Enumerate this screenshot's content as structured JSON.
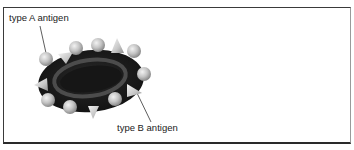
{
  "figure": {
    "labels": {
      "type_a": "type A antigen",
      "type_b": "type B antigen"
    },
    "colors": {
      "cell_body": "#1e1e1e",
      "cell_rim_highlight": "#5a5a5a",
      "antigen_sphere": "#c8c8c8",
      "antigen_cone": "#d2d2d2",
      "border": "#2a2a2a",
      "background": "#ffffff"
    },
    "antigen_counts": {
      "spheres_type_a": 8,
      "cones_type_b": 5
    }
  }
}
